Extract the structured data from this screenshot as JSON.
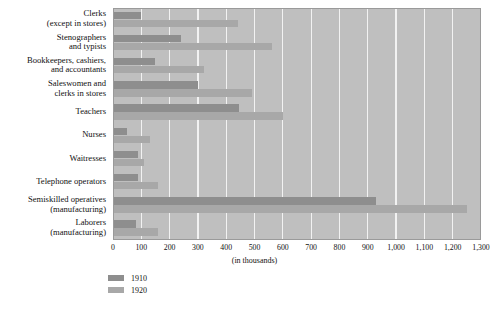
{
  "chart_data": {
    "type": "bar",
    "orientation": "horizontal",
    "title": "",
    "xlabel": "(in thousands)",
    "ylabel": "",
    "xlim": [
      0,
      1300
    ],
    "xticks": [
      0,
      100,
      200,
      300,
      400,
      500,
      600,
      700,
      800,
      900,
      1000,
      1100,
      1200,
      1300
    ],
    "xtick_labels": [
      "0",
      "100",
      "200",
      "300",
      "400",
      "500",
      "600",
      "700",
      "800",
      "900",
      "1,000",
      "1,100",
      "1,200",
      "1,300"
    ],
    "grid": true,
    "grid_axis": "x",
    "legend_position": "bottom-left",
    "plot_background": "#bfbfbf",
    "categories": [
      "Clerks (except in stores)",
      "Stenographers and typists",
      "Bookkeepers, cashiers, and accountants",
      "Saleswomen and clerks in stores",
      "Teachers",
      "Nurses",
      "Waitresses",
      "Telephone operators",
      "Semiskilled operatives (manufacturing)",
      "Laborers (manufacturing)"
    ],
    "category_lines": [
      [
        "Clerks",
        "(except in stores)"
      ],
      [
        "Stenographers",
        "and typists"
      ],
      [
        "Bookkeepers, cashiers,",
        "and accountants"
      ],
      [
        "Saleswomen and",
        "clerks in stores"
      ],
      [
        "Teachers",
        ""
      ],
      [
        "Nurses",
        ""
      ],
      [
        "Waitresses",
        ""
      ],
      [
        "Telephone operators",
        ""
      ],
      [
        "Semiskilled operatives",
        "(manufacturing)"
      ],
      [
        "Laborers",
        "(manufacturing)"
      ]
    ],
    "series": [
      {
        "name": "1910",
        "color": "#8e8e8e",
        "values": [
          100,
          240,
          150,
          300,
          445,
          50,
          90,
          90,
          930,
          80
        ]
      },
      {
        "name": "1920",
        "color": "#a8a8a8",
        "values": [
          440,
          560,
          320,
          490,
          600,
          130,
          110,
          160,
          1250,
          160
        ]
      }
    ]
  },
  "legend": {
    "entries": [
      {
        "label": "1910",
        "color": "#8e8e8e"
      },
      {
        "label": "1920",
        "color": "#a8a8a8"
      }
    ]
  }
}
